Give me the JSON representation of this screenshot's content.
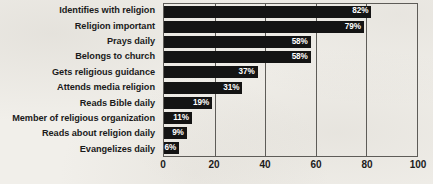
{
  "chart_data": {
    "type": "bar",
    "orientation": "horizontal",
    "title": "",
    "xlabel": "",
    "ylabel": "",
    "xlim": [
      0,
      100
    ],
    "xticks": [
      0,
      20,
      40,
      60,
      80,
      100
    ],
    "grid": true,
    "legend": false,
    "bar_color": "#141414",
    "value_label_color": "#ffffff",
    "value_suffix": "%",
    "categories": [
      "Identifies with religion",
      "Religion important",
      "Prays daily",
      "Belongs to church",
      "Gets religious guidance",
      "Attends media religion",
      "Reads Bible daily",
      "Member of religious organization",
      "Reads about religion daily",
      "Evangelizes daily"
    ],
    "values": [
      82,
      79,
      58,
      58,
      37,
      31,
      19,
      11,
      9,
      6
    ],
    "value_labels": [
      "82%",
      "79%",
      "58%",
      "58%",
      "37%",
      "31%",
      "19%",
      "11%",
      "9%",
      "6%"
    ]
  }
}
